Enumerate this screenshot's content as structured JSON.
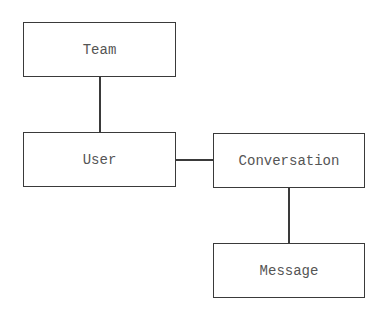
{
  "diagram": {
    "type": "entity-relationship",
    "nodes": [
      {
        "id": "team",
        "label": "Team",
        "x": 23,
        "y": 22,
        "w": 153,
        "h": 55
      },
      {
        "id": "user",
        "label": "User",
        "x": 23,
        "y": 132,
        "w": 153,
        "h": 55
      },
      {
        "id": "conversation",
        "label": "Conversation",
        "x": 213,
        "y": 133,
        "w": 152,
        "h": 55
      },
      {
        "id": "message",
        "label": "Message",
        "x": 213,
        "y": 243,
        "w": 152,
        "h": 55
      }
    ],
    "edges": [
      {
        "from": "team",
        "to": "user"
      },
      {
        "from": "user",
        "to": "conversation"
      },
      {
        "from": "conversation",
        "to": "message"
      }
    ],
    "colors": {
      "stroke": "#3a3a3a",
      "text": "#555555",
      "background": "#ffffff"
    }
  }
}
